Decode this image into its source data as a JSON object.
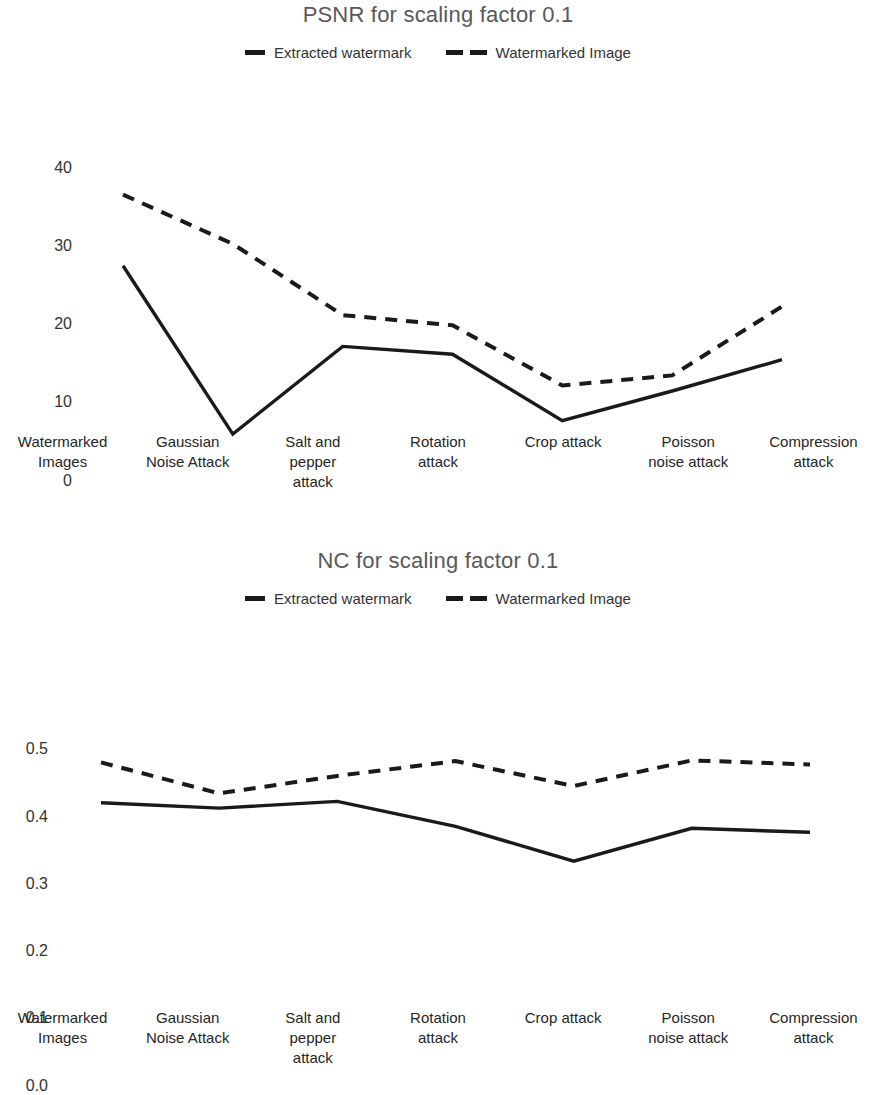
{
  "charts": [
    {
      "title": "PSNR for scaling factor 0.1",
      "legend": [
        {
          "label": "Extracted watermark",
          "style": "solid"
        },
        {
          "label": "Watermarked Image",
          "style": "dashed"
        }
      ],
      "yticks": [
        "40",
        "30",
        "20",
        "10",
        "0"
      ],
      "categories": [
        "Watermarked\nImages",
        "Gaussian\nNoise Attack",
        "Salt and\npepper\nattack",
        "Rotation\nattack",
        "Crop attack",
        "Poisson\nnoise attack",
        "Compression\nattack"
      ]
    },
    {
      "title": "NC for scaling factor 0.1",
      "legend": [
        {
          "label": "Extracted watermark",
          "style": "solid"
        },
        {
          "label": "Watermarked Image",
          "style": "dashed"
        }
      ],
      "yticks": [
        "0.5",
        "0.4",
        "0.3",
        "0.2",
        "0.1",
        "0.0"
      ],
      "categories": [
        "Watermarked\nImages",
        "Gaussian\nNoise Attack",
        "Salt and\npepper\nattack",
        "Rotation\nattack",
        "Crop attack",
        "Poisson\nnoise attack",
        "Compression\nattack"
      ]
    }
  ],
  "chart_data": [
    {
      "type": "line",
      "title": "PSNR for scaling factor 0.1",
      "xlabel": "",
      "ylabel": "",
      "ylim": [
        0,
        40
      ],
      "yticks": [
        0,
        10,
        20,
        30,
        40
      ],
      "grid": false,
      "legend_position": "top-center",
      "categories": [
        "Watermarked Images",
        "Gaussian Noise Attack",
        "Salt and pepper attack",
        "Rotation attack",
        "Crop attack",
        "Poisson noise attack",
        "Compression attack"
      ],
      "series": [
        {
          "name": "Extracted watermark",
          "style": "solid",
          "color": "#1a1a1a",
          "values": [
            27.5,
            6.0,
            17.2,
            16.2,
            7.7,
            11.5,
            15.5
          ]
        },
        {
          "name": "Watermarked Image",
          "style": "dashed",
          "color": "#1a1a1a",
          "values": [
            36.6,
            30.3,
            21.2,
            19.9,
            12.2,
            13.5,
            22.3
          ]
        }
      ]
    },
    {
      "type": "line",
      "title": "NC for scaling factor 0.1",
      "xlabel": "",
      "ylabel": "",
      "ylim": [
        0.0,
        0.5
      ],
      "yticks": [
        0.0,
        0.1,
        0.2,
        0.3,
        0.4,
        0.5
      ],
      "grid": false,
      "legend_position": "top-center",
      "categories": [
        "Watermarked Images",
        "Gaussian Noise Attack",
        "Salt and pepper attack",
        "Rotation attack",
        "Crop attack",
        "Poisson noise attack",
        "Compression attack"
      ],
      "series": [
        {
          "name": "Extracted watermark",
          "style": "solid",
          "color": "#1a1a1a",
          "values": [
            0.42,
            0.412,
            0.422,
            0.385,
            0.333,
            0.382,
            0.376
          ]
        },
        {
          "name": "Watermarked Image",
          "style": "dashed",
          "color": "#1a1a1a",
          "values": [
            0.48,
            0.434,
            0.46,
            0.482,
            0.445,
            0.483,
            0.477
          ]
        }
      ]
    }
  ]
}
